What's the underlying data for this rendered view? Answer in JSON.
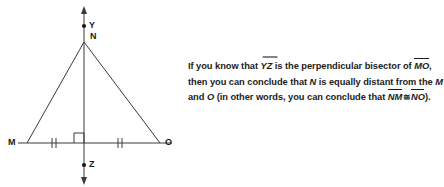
{
  "diagram": {
    "name": "perpendicular-bisector-triangle",
    "points": [
      {
        "id": "Y",
        "label": "Y",
        "x": 84,
        "y": 26,
        "dot": true,
        "label_dx": 5,
        "label_dy": -4
      },
      {
        "id": "N",
        "label": "N",
        "x": 84,
        "y": 42,
        "dot": false,
        "label_dx": 6,
        "label_dy": -10
      },
      {
        "id": "M",
        "label": "M",
        "x": 27,
        "y": 143,
        "dot": false,
        "label_dx": -17,
        "label_dy": -4
      },
      {
        "id": "O",
        "label": "O",
        "x": 160,
        "y": 143,
        "dot": false,
        "label_dx": 5,
        "label_dy": -4
      },
      {
        "id": "Z",
        "label": "Z",
        "x": 84,
        "y": 165,
        "dot": true,
        "label_dx": 5,
        "label_dy": -4
      }
    ],
    "segments": [
      {
        "name": "side-MN",
        "x1": 27,
        "y1": 143,
        "x2": 84,
        "y2": 42
      },
      {
        "name": "side-NO",
        "x1": 84,
        "y1": 42,
        "x2": 160,
        "y2": 143
      },
      {
        "name": "base-MO",
        "x1": 18,
        "y1": 143,
        "x2": 172,
        "y2": 143
      }
    ],
    "vertical_line": {
      "name": "line-YZ",
      "x": 84,
      "y_top": 8,
      "y_bottom": 183,
      "arrow_top": true,
      "arrow_bottom": true
    },
    "right_angle": {
      "name": "right-angle-marker",
      "x": 74,
      "y": 133,
      "size": 10
    },
    "tick_marks": [
      {
        "name": "tick-mark-MY",
        "x": 55,
        "y": 143,
        "count": 2
      },
      {
        "name": "tick-mark-YO",
        "x": 120,
        "y": 143,
        "count": 2
      }
    ],
    "stroke_color": "#3a3a3a",
    "label_color": "#1a1a1a"
  },
  "prose": {
    "line1": {
      "a": "If you know that ",
      "ray": "YZ",
      "b": " is the perpendicular bisector of ",
      "seg": "MO",
      "c": ","
    },
    "line2": {
      "a": "then you can conclude that ",
      "italic1": "N",
      "b": " is equally distant from the ",
      "italic2": "M"
    },
    "line3": {
      "a": "and ",
      "italic1": "O",
      "b": " (in other words, you can conclude that ",
      "seg1": "NM",
      "cong": "≅",
      "seg2": "NO",
      "c": ")."
    }
  },
  "colors": {
    "background": "#ffffff",
    "ink": "#1c1c1c",
    "diagram_stroke": "#3a3a3a"
  }
}
